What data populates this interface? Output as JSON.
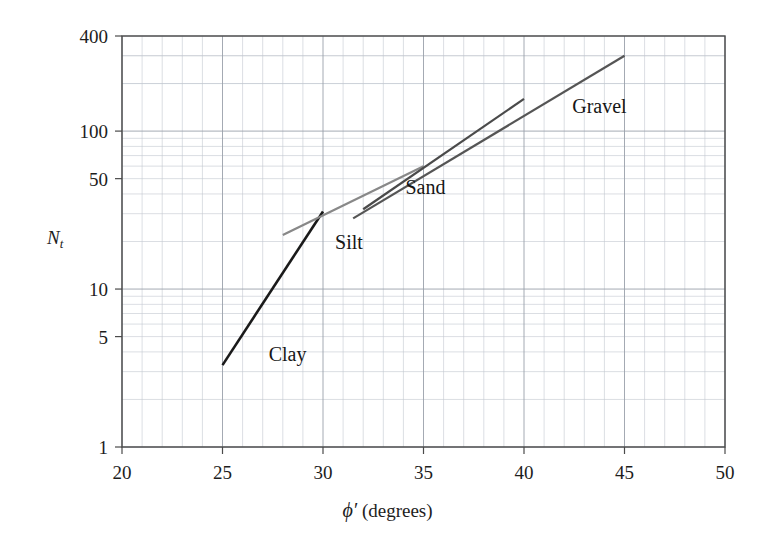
{
  "chart_data": {
    "type": "line",
    "title": "",
    "xlabel": "ϕ′ (degrees)",
    "ylabel": "N_t",
    "ylabel_base": "N",
    "ylabel_sub": "t",
    "xscale": "linear",
    "yscale": "log",
    "xlim": [
      20,
      50
    ],
    "ylim": [
      1,
      400
    ],
    "grid": true,
    "grid_color": "#9aa0aa",
    "minor_grid_color": "#c3c8d0",
    "legend": "inline-annotations",
    "x_major_ticks": [
      20,
      25,
      30,
      35,
      40,
      45,
      50
    ],
    "x_minor_tick_step": 1,
    "y_tick_labels": [
      1,
      5,
      10,
      50,
      100,
      400
    ],
    "y_major_decades": [
      1,
      10,
      100
    ],
    "series": [
      {
        "name": "Clay",
        "color": "#1a1a1a",
        "width": 2.6,
        "points": [
          [
            25,
            3.3
          ],
          [
            30,
            31
          ]
        ]
      },
      {
        "name": "Silt",
        "color": "#888888",
        "width": 2.2,
        "points": [
          [
            28,
            22
          ],
          [
            35,
            60
          ]
        ]
      },
      {
        "name": "Sand",
        "color": "#4a4a4a",
        "width": 2.2,
        "points": [
          [
            32,
            32
          ],
          [
            40,
            160
          ]
        ]
      },
      {
        "name": "Gravel",
        "color": "#555555",
        "width": 2.2,
        "points": [
          [
            31.5,
            28
          ],
          [
            45,
            300
          ]
        ]
      }
    ],
    "annotations": [
      {
        "text": "Clay",
        "x": 27.3,
        "y": 3.9
      },
      {
        "text": "Silt",
        "x": 30.6,
        "y": 20.0
      },
      {
        "text": "Sand",
        "x": 34.1,
        "y": 44.0
      },
      {
        "text": "Gravel",
        "x": 42.4,
        "y": 145.0
      }
    ]
  },
  "axes": {
    "y_ticks": [
      {
        "label": "400",
        "value": 400
      },
      {
        "label": "100",
        "value": 100
      },
      {
        "label": "50",
        "value": 50
      },
      {
        "label": "10",
        "value": 10
      },
      {
        "label": "5",
        "value": 5
      },
      {
        "label": "1",
        "value": 1
      }
    ],
    "x_ticks": [
      {
        "label": "20",
        "value": 20
      },
      {
        "label": "25",
        "value": 25
      },
      {
        "label": "30",
        "value": 30
      },
      {
        "label": "35",
        "value": 35
      },
      {
        "label": "40",
        "value": 40
      },
      {
        "label": "45",
        "value": 45
      },
      {
        "label": "50",
        "value": 50
      }
    ],
    "x_title_phi": "ϕ′",
    "x_title_rest": " (degrees)",
    "y_title_base": "N",
    "y_title_sub": "t"
  }
}
